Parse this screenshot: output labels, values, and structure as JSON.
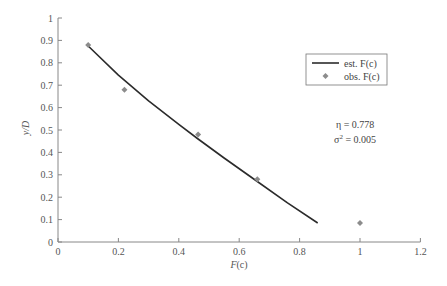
{
  "chart_data": {
    "type": "scatter",
    "title": "",
    "xlabel": "F(c)",
    "ylabel": "y/D",
    "xlim": [
      0,
      1.2
    ],
    "ylim": [
      0,
      1
    ],
    "xticks": [
      "0",
      "0.2",
      "0.4",
      "0.6",
      "0.8",
      "1",
      "1.2"
    ],
    "yticks": [
      "0",
      "0.1",
      "0.2",
      "0.3",
      "0.4",
      "0.5",
      "0.6",
      "0.7",
      "0.8",
      "0.9",
      "1"
    ],
    "grid": false,
    "legend_position": "upper right",
    "series": [
      {
        "name": "est. F(c)",
        "type": "line",
        "color": "#2b2b2b",
        "x": [
          0.1,
          0.2,
          0.3,
          0.4,
          0.464,
          0.55,
          0.66,
          0.76,
          0.86
        ],
        "y": [
          0.875,
          0.745,
          0.63,
          0.525,
          0.46,
          0.375,
          0.27,
          0.175,
          0.085
        ]
      },
      {
        "name": "obs. F(c)",
        "type": "scatter",
        "marker": "diamond",
        "color": "#8c8c8c",
        "x": [
          0.1,
          0.22,
          0.464,
          0.66,
          1.0
        ],
        "y": [
          0.88,
          0.68,
          0.48,
          0.28,
          0.085
        ]
      }
    ],
    "annotations": [
      {
        "text": "η = 0.778"
      },
      {
        "text": "σ² = 0.005"
      }
    ]
  },
  "labels": {
    "xlabel_main": "F",
    "xlabel_paren": "(c)",
    "ylabel": "y/D",
    "legend_est": "est. F(c)",
    "legend_obs": "obs. F(c)",
    "eta_symbol": "η",
    "eta_value": " = 0.778",
    "sigma_symbol": "σ",
    "sigma_sup": "2",
    "sigma_value": " = 0.005"
  }
}
